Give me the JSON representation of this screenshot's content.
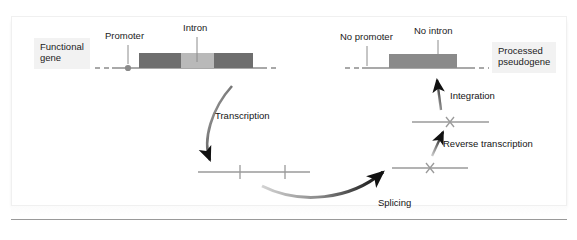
{
  "figure": {
    "background_color": "#ffffff",
    "panel_color": "#ffffff"
  },
  "colors": {
    "exon": "#6e6e6e",
    "intron": "#b9b9b9",
    "pseudogene_block": "#8a8a8a",
    "dna_line": "#8c8c8c",
    "rna_line": "#9a9a9a",
    "arrow_dark": "#111111",
    "label_box_bg": "#f2f2f2",
    "text": "#1b1b1b"
  },
  "labels": {
    "functional_gene": "Functional\ngene",
    "functional_gene_line1": "Functional",
    "functional_gene_line2": "gene",
    "promoter": "Promoter",
    "intron": "Intron",
    "no_promoter": "No promoter",
    "no_intron": "No intron",
    "processed_pseudogene_line1": "Processed",
    "processed_pseudogene_line2": "pseudogene",
    "transcription": "Transcription",
    "splicing": "Splicing",
    "reverse_transcription": "Reverse transcription",
    "integration": "Integration"
  },
  "structures": {
    "functional_gene": {
      "name": "functional-gene-locus",
      "dna_line": {
        "x1": 95,
        "x2": 270,
        "y": 68
      },
      "promoter_marker": {
        "x": 128,
        "y": 68,
        "radius": 3
      },
      "segments": [
        {
          "type": "exon",
          "x": 139,
          "width": 42,
          "label": "exon-1"
        },
        {
          "type": "intron",
          "x": 181,
          "width": 33,
          "label": "intron"
        },
        {
          "type": "exon",
          "x": 214,
          "width": 39,
          "label": "exon-2"
        }
      ]
    },
    "pre_mrna": {
      "name": "primary-transcript",
      "line": {
        "x1": 198,
        "x2": 310,
        "y": 172
      },
      "ticks": [
        240,
        285
      ]
    },
    "mrna": {
      "name": "spliced-mrna",
      "line": {
        "x1": 390,
        "x2": 468,
        "y": 168
      },
      "x_mark": 430
    },
    "cdna": {
      "name": "cdna-copy",
      "line": {
        "x1": 410,
        "x2": 488,
        "y": 122
      },
      "x_mark": 450
    },
    "pseudogene": {
      "name": "processed-pseudogene-locus",
      "dna_line": {
        "x1": 345,
        "x2": 490,
        "y": 68
      },
      "block": {
        "x": 389,
        "width": 68,
        "label": "pseudogene-exon"
      },
      "no_promoter_tick": {
        "x": 367,
        "y_top": 44,
        "y_bottom": 66
      },
      "no_intron_tick": {
        "x": 438,
        "y_top": 40,
        "y_bottom": 66
      }
    }
  },
  "arrows": [
    {
      "name": "transcription-arrow",
      "label": "Transcription"
    },
    {
      "name": "splicing-arrow",
      "label": "Splicing"
    },
    {
      "name": "reverse-transcription-arrow",
      "label": "Reverse transcription"
    },
    {
      "name": "integration-arrow",
      "label": "Integration"
    }
  ]
}
